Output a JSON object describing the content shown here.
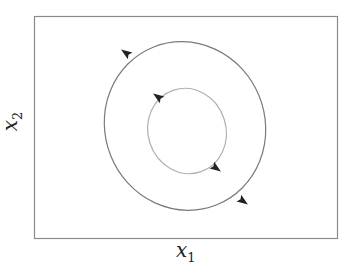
{
  "diagram": {
    "type": "phase-portrait",
    "x_axis_label": {
      "var": "x",
      "sub": "1"
    },
    "y_axis_label": {
      "var": "x",
      "sub": "2"
    },
    "frame": {
      "x": 34,
      "y": 16,
      "width": 303,
      "height": 222,
      "stroke": "#8a8a8a"
    },
    "orbits": [
      {
        "name": "outer-orbit",
        "cx": 185,
        "cy": 126,
        "rx": 80,
        "ry": 85,
        "rotate": -22,
        "stroke": "#7a7a7a",
        "arrows": [
          {
            "x": 126,
            "y": 53,
            "angle": 215
          },
          {
            "x": 243,
            "y": 201,
            "angle": 35
          }
        ]
      },
      {
        "name": "inner-orbit",
        "cx": 187,
        "cy": 131,
        "rx": 39,
        "ry": 43,
        "rotate": -18,
        "stroke": "#b0b0b0",
        "arrows": [
          {
            "x": 158,
            "y": 97,
            "angle": 215
          },
          {
            "x": 216,
            "y": 168,
            "angle": 35
          }
        ]
      }
    ],
    "arrow_color": "#222222"
  }
}
